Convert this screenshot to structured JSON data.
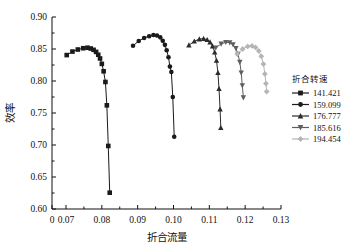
{
  "chart_data": {
    "type": "line",
    "title": "",
    "xlabel": "折合流量",
    "ylabel": "效率",
    "xlim": [
      0.0,
      0.13
    ],
    "ylim": [
      0.6,
      0.9
    ],
    "xticks": [
      0,
      0.07,
      0.08,
      0.09,
      0.1,
      0.11,
      0.12,
      0.13
    ],
    "xtick_labels": [
      "0",
      "0.07",
      "0.08",
      "0.09",
      "0.10",
      "0.11",
      "0.12",
      "0.13"
    ],
    "yticks": [
      0.6,
      0.65,
      0.7,
      0.75,
      0.8,
      0.85,
      0.9
    ],
    "ytick_labels": [
      "0.60",
      "0.65",
      "0.70",
      "0.75",
      "0.80",
      "0.85",
      "0.90"
    ],
    "xaxis_break_after_first_tick": true,
    "grid": false,
    "legend_position": "right",
    "legend_title": "折合转速",
    "series": [
      {
        "name": "141.421",
        "color": "#1a1a1a",
        "marker": "square",
        "points": [
          [
            0.0702,
            0.8405
          ],
          [
            0.0718,
            0.846
          ],
          [
            0.0733,
            0.8492
          ],
          [
            0.0748,
            0.8512
          ],
          [
            0.076,
            0.852
          ],
          [
            0.0769,
            0.8508
          ],
          [
            0.0777,
            0.8487
          ],
          [
            0.0784,
            0.8455
          ],
          [
            0.079,
            0.841
          ],
          [
            0.0795,
            0.8352
          ],
          [
            0.08,
            0.8268
          ],
          [
            0.0805,
            0.8152
          ],
          [
            0.081,
            0.7985
          ],
          [
            0.0814,
            0.762
          ],
          [
            0.0818,
            0.6985
          ],
          [
            0.0822,
            0.6255
          ]
        ]
      },
      {
        "name": "159.099",
        "color": "#1a1a1a",
        "marker": "circle",
        "points": [
          [
            0.0887,
            0.855
          ],
          [
            0.0903,
            0.8625
          ],
          [
            0.0918,
            0.8672
          ],
          [
            0.0932,
            0.87
          ],
          [
            0.0944,
            0.8718
          ],
          [
            0.0954,
            0.8712
          ],
          [
            0.0963,
            0.8682
          ],
          [
            0.097,
            0.863
          ],
          [
            0.0976,
            0.8565
          ],
          [
            0.0981,
            0.848
          ],
          [
            0.0986,
            0.8372
          ],
          [
            0.099,
            0.8225
          ],
          [
            0.0994,
            0.814
          ],
          [
            0.0998,
            0.775
          ],
          [
            0.1002,
            0.713
          ]
        ]
      },
      {
        "name": "176.777",
        "color": "#2b2b2b",
        "marker": "triangle-up",
        "points": [
          [
            0.1043,
            0.856
          ],
          [
            0.1058,
            0.862
          ],
          [
            0.1072,
            0.8655
          ],
          [
            0.1084,
            0.8662
          ],
          [
            0.1094,
            0.8645
          ],
          [
            0.1102,
            0.8608
          ],
          [
            0.1109,
            0.8545
          ],
          [
            0.1115,
            0.845
          ],
          [
            0.112,
            0.832
          ],
          [
            0.1124,
            0.813
          ],
          [
            0.1127,
            0.788
          ],
          [
            0.113,
            0.756
          ],
          [
            0.1132,
            0.727
          ]
        ]
      },
      {
        "name": "185.616",
        "color": "#5e5e5e",
        "marker": "triangle-down",
        "points": [
          [
            0.1118,
            0.852
          ],
          [
            0.1133,
            0.858
          ],
          [
            0.1146,
            0.8605
          ],
          [
            0.1157,
            0.86
          ],
          [
            0.1166,
            0.857
          ],
          [
            0.1174,
            0.851
          ],
          [
            0.118,
            0.842
          ],
          [
            0.1185,
            0.8295
          ],
          [
            0.1189,
            0.813
          ],
          [
            0.1192,
            0.793
          ],
          [
            0.1195,
            0.774
          ]
        ]
      },
      {
        "name": "194.454",
        "color": "#b5b5b5",
        "marker": "diamond",
        "points": [
          [
            0.1178,
            0.842
          ],
          [
            0.1193,
            0.85
          ],
          [
            0.1207,
            0.854
          ],
          [
            0.1219,
            0.8548
          ],
          [
            0.1229,
            0.8525
          ],
          [
            0.1238,
            0.847
          ],
          [
            0.1245,
            0.8385
          ],
          [
            0.1251,
            0.8265
          ],
          [
            0.1255,
            0.811
          ],
          [
            0.1258,
            0.796
          ],
          [
            0.126,
            0.7835
          ]
        ]
      }
    ]
  }
}
